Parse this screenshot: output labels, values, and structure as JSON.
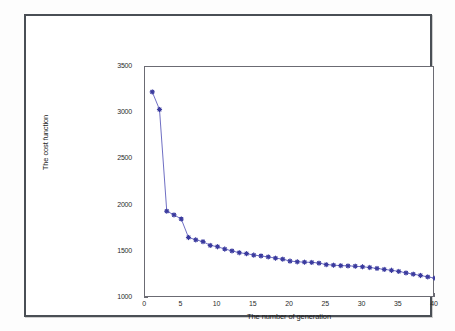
{
  "chart_data": {
    "type": "line",
    "title": "",
    "subtitle": "",
    "xlabel": "The number of generation",
    "ylabel": "The cost function",
    "xlim": [
      0,
      40
    ],
    "ylim": [
      1000,
      3500
    ],
    "xticks": [
      0,
      5,
      10,
      15,
      20,
      25,
      30,
      35,
      40
    ],
    "yticks": [
      1000,
      1500,
      2000,
      2500,
      3000,
      3500
    ],
    "grid": false,
    "legend": "none",
    "marker": "star",
    "line_color": "#4a4ab4",
    "marker_color": "#3a3a9e",
    "x": [
      1,
      2,
      3,
      4,
      5,
      6,
      7,
      8,
      9,
      10,
      11,
      12,
      13,
      14,
      15,
      16,
      17,
      18,
      19,
      20,
      21,
      22,
      23,
      24,
      25,
      26,
      27,
      28,
      29,
      30,
      31,
      32,
      33,
      34,
      35,
      36,
      37,
      38,
      39,
      40
    ],
    "values": [
      3230,
      3040,
      1940,
      1900,
      1855,
      1655,
      1630,
      1610,
      1570,
      1555,
      1530,
      1510,
      1490,
      1480,
      1465,
      1455,
      1445,
      1432,
      1420,
      1400,
      1392,
      1388,
      1386,
      1378,
      1362,
      1356,
      1350,
      1348,
      1344,
      1338,
      1330,
      1320,
      1310,
      1300,
      1288,
      1272,
      1258,
      1244,
      1228,
      1215
    ],
    "series": [
      {
        "name": "cost",
        "values": [
          3230,
          3040,
          1940,
          1900,
          1855,
          1655,
          1630,
          1610,
          1570,
          1555,
          1530,
          1510,
          1490,
          1480,
          1465,
          1455,
          1445,
          1432,
          1420,
          1400,
          1392,
          1388,
          1386,
          1378,
          1362,
          1356,
          1350,
          1348,
          1344,
          1338,
          1330,
          1320,
          1310,
          1300,
          1288,
          1272,
          1258,
          1244,
          1228,
          1215
        ]
      }
    ]
  }
}
